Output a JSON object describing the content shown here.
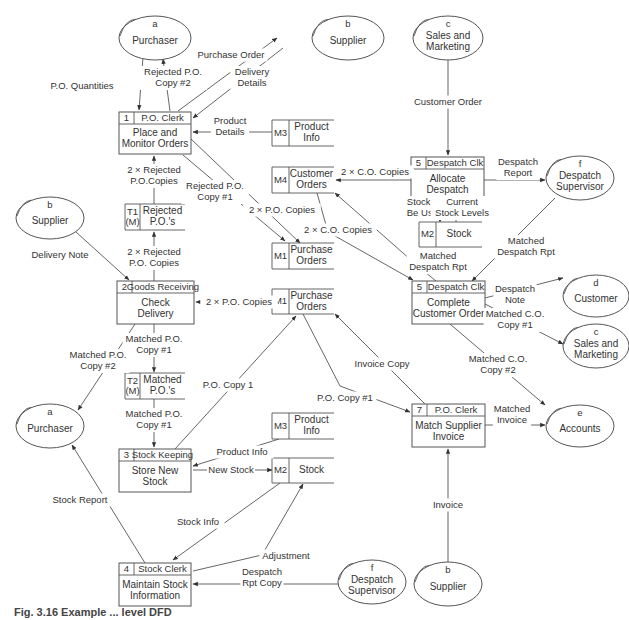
{
  "caption": "Fig. 3.16  Example ... level DFD",
  "entities": [
    {
      "id": "a1",
      "code": "a",
      "name": [
        "Purchaser"
      ],
      "cx": 155,
      "cy": 38,
      "rx": 36,
      "ry": 22
    },
    {
      "id": "b1",
      "code": "b",
      "name": [
        "Supplier"
      ],
      "cx": 348,
      "cy": 38,
      "rx": 36,
      "ry": 22
    },
    {
      "id": "c1",
      "code": "c",
      "name": [
        "Sales and",
        "Marketing"
      ],
      "cx": 448,
      "cy": 38,
      "rx": 35,
      "ry": 22
    },
    {
      "id": "f1",
      "code": "f",
      "name": [
        "Despatch",
        "Supervisor"
      ],
      "cx": 580,
      "cy": 178,
      "rx": 34,
      "ry": 22
    },
    {
      "id": "b2",
      "code": "b",
      "name": [
        "Supplier"
      ],
      "cx": 50,
      "cy": 218,
      "rx": 34,
      "ry": 21
    },
    {
      "id": "d1",
      "code": "d",
      "name": [
        "Customer"
      ],
      "cx": 596,
      "cy": 296,
      "rx": 33,
      "ry": 21
    },
    {
      "id": "c2",
      "code": "c",
      "name": [
        "Sales and",
        "Marketing"
      ],
      "cx": 596,
      "cy": 346,
      "rx": 33,
      "ry": 22
    },
    {
      "id": "a2",
      "code": "a",
      "name": [
        "Purchaser"
      ],
      "cx": 50,
      "cy": 426,
      "rx": 34,
      "ry": 22
    },
    {
      "id": "e1",
      "code": "e",
      "name": [
        "Accounts"
      ],
      "cx": 580,
      "cy": 426,
      "rx": 34,
      "ry": 21
    },
    {
      "id": "f2",
      "code": "f",
      "name": [
        "Despatch",
        "Supervisor"
      ],
      "cx": 372,
      "cy": 582,
      "rx": 34,
      "ry": 22
    },
    {
      "id": "b3",
      "code": "b",
      "name": [
        "Supplier"
      ],
      "cx": 448,
      "cy": 584,
      "rx": 34,
      "ry": 22
    }
  ],
  "processes": [
    {
      "id": "p1",
      "num": "1",
      "actor": "P.O. Clerk",
      "name": [
        "Place and",
        "Monitor Orders"
      ],
      "x": 119,
      "y": 112,
      "w": 72,
      "h": 42,
      "nw": 15
    },
    {
      "id": "p5a",
      "num": "5",
      "actor": "Despatch Clk",
      "name": [
        "Allocate",
        "Despatch"
      ],
      "x": 411,
      "y": 157,
      "w": 73,
      "h": 43,
      "nw": 15
    },
    {
      "id": "p2",
      "num": "2",
      "actor": "Goods Receiving",
      "name": [
        "Check",
        "Delivery"
      ],
      "x": 117,
      "y": 281,
      "w": 77,
      "h": 43,
      "nw": 15
    },
    {
      "id": "p5b",
      "num": "5",
      "actor": "Despatch Clk",
      "name": [
        "Complete",
        "Customer Order"
      ],
      "x": 412,
      "y": 281,
      "w": 73,
      "h": 43,
      "nw": 15
    },
    {
      "id": "p7",
      "num": "7",
      "actor": "P.O. Clerk",
      "name": [
        "Match Supplier",
        "Invoice"
      ],
      "x": 412,
      "y": 404,
      "w": 73,
      "h": 43,
      "nw": 15
    },
    {
      "id": "p3",
      "num": "3",
      "actor": "Stock Keeping",
      "name": [
        "Store New",
        "Stock"
      ],
      "x": 119,
      "y": 449,
      "w": 72,
      "h": 43,
      "nw": 15
    },
    {
      "id": "p4",
      "num": "4",
      "actor": "Stock Clerk",
      "name": [
        "Maintain Stock",
        "Information"
      ],
      "x": 119,
      "y": 563,
      "w": 72,
      "h": 43,
      "nw": 15
    }
  ],
  "stores": [
    {
      "id": "m3a",
      "code": "M3",
      "name": [
        "Product",
        "Info"
      ],
      "x": 272,
      "y": 120,
      "w": 62,
      "h": 26,
      "cw": 17
    },
    {
      "id": "m4",
      "code": "M4",
      "name": [
        "Customer",
        "Orders"
      ],
      "x": 272,
      "y": 167,
      "w": 62,
      "h": 26,
      "cw": 17
    },
    {
      "id": "t1",
      "code": [
        "T1",
        "(M)"
      ],
      "name": [
        "Rejected",
        "P.O.'s"
      ],
      "x": 125,
      "y": 204,
      "w": 60,
      "h": 26,
      "cw": 15
    },
    {
      "id": "m2a",
      "code": "M2",
      "name": [
        "Stock"
      ],
      "x": 419,
      "y": 222,
      "w": 63,
      "h": 25,
      "cw": 17
    },
    {
      "id": "m1a",
      "code": "M1",
      "name": [
        "Purchase",
        "Orders"
      ],
      "x": 272,
      "y": 243,
      "w": 62,
      "h": 26,
      "cw": 17
    },
    {
      "id": "m1b",
      "code": "M1",
      "name": [
        "Purchase",
        "Orders"
      ],
      "x": 272,
      "y": 289,
      "w": 62,
      "h": 25,
      "cw": 17
    },
    {
      "id": "t2",
      "code": [
        "T2",
        "(M)"
      ],
      "name": [
        "Matched",
        "P.O.'s"
      ],
      "x": 125,
      "y": 373,
      "w": 60,
      "h": 26,
      "cw": 15
    },
    {
      "id": "m3b",
      "code": "M3",
      "name": [
        "Product",
        "Info"
      ],
      "x": 272,
      "y": 413,
      "w": 62,
      "h": 26,
      "cw": 17
    },
    {
      "id": "m2b",
      "code": "M2",
      "name": [
        "Stock"
      ],
      "x": 272,
      "y": 458,
      "w": 62,
      "h": 25,
      "cw": 17
    }
  ],
  "flows": [
    {
      "label": [
        "P.O. Quantities"
      ],
      "lx": 82,
      "ly": 86,
      "path": "M143,57 L139,110",
      "arrow": "end",
      "lpath": "M115,90 L128,100"
    },
    {
      "label": [
        "Rejected P.O.",
        "Copy #2"
      ],
      "lx": 173,
      "ly": 78,
      "path": "M170,111 L163,59",
      "arrow": "end"
    },
    {
      "label": [
        "Purchase Order"
      ],
      "lx": 231,
      "ly": 55,
      "path": "M178,111 L277,38",
      "arrow": "end"
    },
    {
      "label": [
        "Delivery",
        "Details"
      ],
      "lx": 252,
      "ly": 78,
      "path": "M283,48 L193,118",
      "arrow": "end"
    },
    {
      "label": [
        "Product",
        "Details"
      ],
      "lx": 230,
      "ly": 127,
      "path": "M272,132 L193,132",
      "arrow": "end"
    },
    {
      "label": [
        "2 × Rejected",
        "P.O.Copies"
      ],
      "lx": 154,
      "ly": 176,
      "path": "M154,204 L154,156",
      "arrow": "end"
    },
    {
      "label": [
        "Rejected P.O.",
        "Copy #1"
      ],
      "lx": 215,
      "ly": 192,
      "path": "M183,155 L285,241",
      "arrow": "end"
    },
    {
      "label": [
        "2 × P.O. Copies"
      ],
      "lx": 282,
      "ly": 210,
      "path": "M191,139 L300,243",
      "arrow": "end"
    },
    {
      "label": [
        "Customer Order"
      ],
      "lx": 448,
      "ly": 102,
      "path": "M448,60 L448,155",
      "arrow": "end"
    },
    {
      "label": [
        "2 × C.O. Copies"
      ],
      "lx": 375,
      "ly": 172,
      "path": "M411,180 L336,180",
      "arrow": "end"
    },
    {
      "label": [
        "Despatch",
        "Report"
      ],
      "lx": 518,
      "ly": 168,
      "path": "M484,180 L545,180",
      "arrow": "end"
    },
    {
      "label": [
        "Stock To",
        "Be Used"
      ],
      "lx": 425,
      "ly": 208,
      "path": "M440,200 L440,222",
      "arrow": "end"
    },
    {
      "label": [
        "Current",
        "Stock Levels"
      ],
      "lx": 462,
      "ly": 208,
      "path": "M456,222 L456,200",
      "arrow": "end"
    },
    {
      "label": [
        "2 × C.O. Copies"
      ],
      "lx": 338,
      "ly": 230,
      "path": "M317,193 L328,232 L413,280",
      "arrow": "end"
    },
    {
      "label": [
        "Matched",
        "Despatch Rpt"
      ],
      "lx": 438,
      "ly": 262,
      "path": "M436,281 L420,268 L335,193",
      "arrow": "end"
    },
    {
      "label": [
        "Matched",
        "Despatch Rpt"
      ],
      "lx": 526,
      "ly": 247,
      "path": "M555,198 L472,281",
      "arrow": "end"
    },
    {
      "label": [
        "Delivery Note"
      ],
      "lx": 60,
      "ly": 255,
      "path": "M76,232 L129,280",
      "arrow": "end"
    },
    {
      "label": [
        "2 × Rejected",
        "P.O. Copies"
      ],
      "lx": 154,
      "ly": 258,
      "path": "M154,281 L154,232",
      "arrow": "end"
    },
    {
      "label": [
        "2 × P.O. Copies"
      ],
      "lx": 239,
      "ly": 302,
      "path": "M272,302 L196,302",
      "arrow": "end"
    },
    {
      "label": [
        "Despatch",
        "Note"
      ],
      "lx": 515,
      "ly": 295,
      "path": "M485,298 L563,278",
      "arrow": "end"
    },
    {
      "label": [
        "Matched C.O.",
        "Copy #1"
      ],
      "lx": 515,
      "ly": 320,
      "path": "M485,304 L563,344",
      "arrow": "end"
    },
    {
      "label": [
        "Matched P.O.",
        "Copy #1"
      ],
      "lx": 154,
      "ly": 345,
      "path": "M154,324 L154,372",
      "arrow": "end"
    },
    {
      "label": [
        "Matched P.O.",
        "Copy #2"
      ],
      "lx": 98,
      "ly": 361,
      "path": "M135,324 L78,410",
      "arrow": "end"
    },
    {
      "label": [
        "Invoice Copy"
      ],
      "lx": 382,
      "ly": 364,
      "path": "M425,404 L335,314",
      "arrow": "end"
    },
    {
      "label": [
        "P.O. Copy 1"
      ],
      "lx": 228,
      "ly": 385,
      "path": "M175,449 L296,316",
      "arrow": "end"
    },
    {
      "label": [
        "P.O. Copy #1"
      ],
      "lx": 345,
      "ly": 398,
      "path": "M303,314 L340,386 L410,412",
      "arrow": "end"
    },
    {
      "label": [
        "Matched C.O.",
        "Copy #2"
      ],
      "lx": 498,
      "ly": 365,
      "path": "M450,324 L545,405",
      "arrow": "end"
    },
    {
      "label": [
        "Matched",
        "Invoice"
      ],
      "lx": 512,
      "ly": 415,
      "path": "M485,425 L545,425",
      "arrow": "end"
    },
    {
      "label": [
        "Matched P.O.",
        "Copy #1"
      ],
      "lx": 154,
      "ly": 420,
      "path": "M154,399 L154,447",
      "arrow": "end"
    },
    {
      "label": [
        "Product Info"
      ],
      "lx": 242,
      "ly": 452,
      "path": "M279,439 L193,466",
      "arrow": "end"
    },
    {
      "label": [
        "New Stock"
      ],
      "lx": 231,
      "ly": 470,
      "path": "M193,470 L272,470",
      "arrow": "end"
    },
    {
      "label": [
        "Stock Report"
      ],
      "lx": 80,
      "ly": 500,
      "path": "M145,563 L72,445",
      "arrow": "end"
    },
    {
      "label": [
        "Stock Info"
      ],
      "lx": 198,
      "ly": 522,
      "path": "M280,483 L173,560",
      "arrow": "end"
    },
    {
      "label": [
        "Adjustment"
      ],
      "lx": 286,
      "ly": 556,
      "path": "M193,571 L262,555 L303,484",
      "arrow": "end"
    },
    {
      "label": [
        "Despatch",
        "Rpt Copy"
      ],
      "lx": 262,
      "ly": 578,
      "path": "M338,584 L193,584",
      "arrow": "end"
    },
    {
      "label": [
        "Invoice"
      ],
      "lx": 448,
      "ly": 505,
      "path": "M448,562 L448,449",
      "arrow": "end"
    }
  ]
}
